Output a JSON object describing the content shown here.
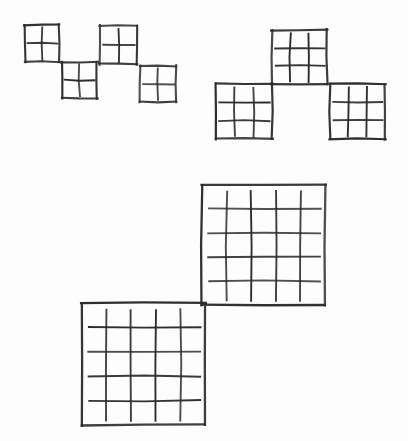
{
  "document": {
    "title": "Hand-drawn grid squares figure",
    "background_color": "#fdfdfd",
    "ink_color": "#2b2b2b",
    "width": 408,
    "height": 441
  },
  "figure": {
    "groups": [
      {
        "name": "top-left-cluster",
        "label": "Group of four 2 by 2 grid squares",
        "divisions": 2,
        "count": 4,
        "squares": [
          {
            "name": "square-a1",
            "x": 25,
            "y": 25,
            "w": 34,
            "h": 37,
            "divisions": 2
          },
          {
            "name": "square-a2",
            "x": 62,
            "y": 62,
            "w": 35,
            "h": 36,
            "divisions": 2
          },
          {
            "name": "square-a3",
            "x": 100,
            "y": 26,
            "w": 37,
            "h": 38,
            "divisions": 2
          },
          {
            "name": "square-a4",
            "x": 140,
            "y": 66,
            "w": 36,
            "h": 36,
            "divisions": 2
          }
        ]
      },
      {
        "name": "top-right-cluster",
        "label": "Group of three 3 by 3 grid squares",
        "divisions": 3,
        "count": 3,
        "squares": [
          {
            "name": "square-b1",
            "x": 272,
            "y": 30,
            "w": 55,
            "h": 54,
            "divisions": 3
          },
          {
            "name": "square-b2",
            "x": 216,
            "y": 84,
            "w": 56,
            "h": 55,
            "divisions": 3
          },
          {
            "name": "square-b3",
            "x": 330,
            "y": 84,
            "w": 55,
            "h": 55,
            "divisions": 3
          }
        ]
      },
      {
        "name": "bottom-cluster",
        "label": "Group of two 5 by 5 grid squares",
        "divisions": 5,
        "count": 2,
        "squares": [
          {
            "name": "square-c1",
            "x": 202,
            "y": 185,
            "w": 123,
            "h": 120,
            "divisions": 5
          },
          {
            "name": "square-c2",
            "x": 82,
            "y": 303,
            "w": 123,
            "h": 122,
            "divisions": 5
          }
        ]
      }
    ]
  },
  "chart_data": {
    "type": "table",
    "xlabel": "",
    "ylabel": "",
    "categories": [
      "top-left-cluster",
      "top-right-cluster",
      "bottom-cluster"
    ],
    "series": [
      {
        "name": "squares per cluster",
        "values": [
          4,
          3,
          2
        ]
      },
      {
        "name": "grid divisions per square",
        "values": [
          2,
          3,
          5
        ]
      }
    ],
    "annotations": [],
    "grid": false,
    "legend": "none"
  }
}
